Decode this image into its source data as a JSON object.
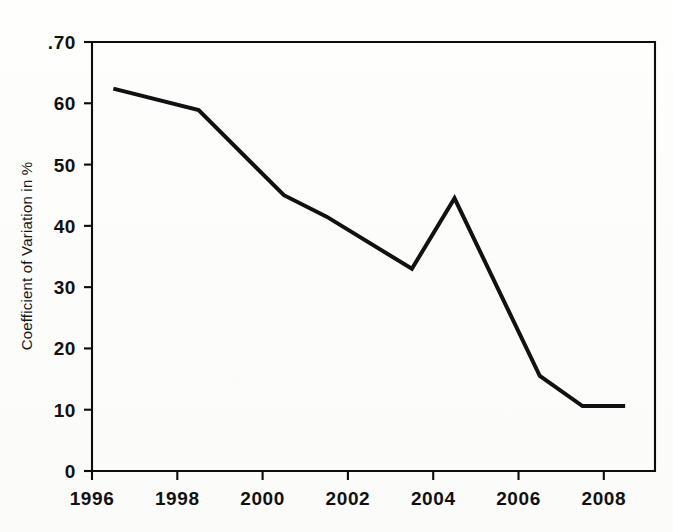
{
  "figure": {
    "background_color": "#fdfdfc",
    "ink_color": "#111111"
  },
  "chart_data": {
    "type": "line",
    "title": "",
    "subtitle": "",
    "xlabel": "",
    "ylabel": "Coefficient of Variation in %",
    "xlim": [
      1996,
      2009.2
    ],
    "ylim": [
      0,
      70
    ],
    "grid": false,
    "legend": null,
    "legend_position": "none",
    "x_tick_labels": [
      "1996",
      "1998",
      "2000",
      "2002",
      "2004",
      "2006",
      "2008"
    ],
    "x_ticks": [
      1996,
      1998,
      2000,
      2002,
      2004,
      2006,
      2008
    ],
    "y_tick_labels": [
      "0",
      "10",
      "20",
      "30",
      "40",
      "50",
      "60",
      ".70"
    ],
    "y_ticks": [
      0,
      10,
      20,
      30,
      40,
      50,
      60,
      70
    ],
    "series": [
      {
        "name": "Coefficient of Variation",
        "color": "#111111",
        "line_width": 4.0,
        "x": [
          1996.5,
          1998.5,
          2000.5,
          2001.5,
          2003.5,
          2004.5,
          2006.5,
          2007.5,
          2008.5
        ],
        "values": [
          62.4,
          58.9,
          45.0,
          41.5,
          33.0,
          44.5,
          15.5,
          10.6,
          10.6
        ]
      }
    ],
    "annotations": []
  }
}
